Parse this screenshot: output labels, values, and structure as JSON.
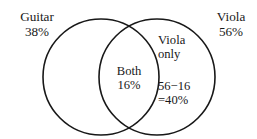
{
  "diagram": {
    "type": "venn",
    "title": "",
    "background_color": "#ffffff",
    "stroke_color": "#181818",
    "text_color": "#181818",
    "left_set": {
      "name": "Guitar",
      "percent": "38%"
    },
    "right_set": {
      "name": "Viola",
      "percent": "56%"
    },
    "intersection": {
      "label": "Both",
      "percent": "16%"
    },
    "right_only": {
      "label_line1": "Viola",
      "label_line2": "only",
      "calc_line1": "56−16",
      "calc_line2": "=40%"
    }
  }
}
